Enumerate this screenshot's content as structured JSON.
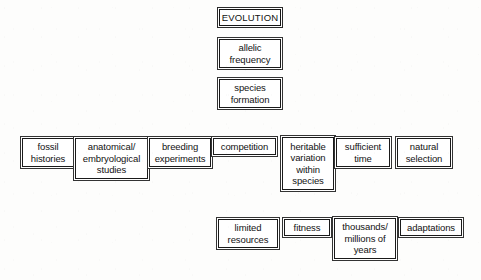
{
  "diagram": {
    "background_color": "#fdfdfc",
    "box_border_color": "#1a1a1a",
    "text_color": "#121212",
    "connectors": "none",
    "columns": {
      "top_stack": [
        {
          "id": "evolution",
          "label": "EVOLUTION",
          "x": 219,
          "y": 9,
          "w": 62,
          "h": 17,
          "style": "caps"
        },
        {
          "id": "allelic-frequency",
          "label": "allelic\nfrequency",
          "x": 219,
          "y": 39,
          "w": 62,
          "h": 29,
          "style": "thin"
        },
        {
          "id": "species-formation",
          "label": "species\nformation",
          "x": 219,
          "y": 79,
          "w": 62,
          "h": 29,
          "style": "thin"
        }
      ],
      "middle_row": [
        {
          "id": "fossil-histories",
          "label": "fossil\nhistories",
          "x": 22,
          "y": 138,
          "w": 52,
          "h": 29,
          "style": "thin"
        },
        {
          "id": "anatomical-embryological-studies",
          "label": "anatomical/\nembryological\nstudies",
          "x": 75,
          "y": 138,
          "w": 73,
          "h": 41,
          "style": "thin"
        },
        {
          "id": "breeding-experiments",
          "label": "breeding\nexperiments",
          "x": 149,
          "y": 138,
          "w": 62,
          "h": 29,
          "style": "thin"
        },
        {
          "id": "competition",
          "label": "competition",
          "x": 213,
          "y": 138,
          "w": 63,
          "h": 17,
          "style": "thin"
        },
        {
          "id": "heritable-variation-within-species",
          "label": "heritable\nvariation\nwithin\nspecies",
          "x": 282,
          "y": 137,
          "w": 52,
          "h": 53,
          "style": "thin"
        },
        {
          "id": "sufficient-time",
          "label": "sufficient\ntime",
          "x": 336,
          "y": 138,
          "w": 54,
          "h": 29,
          "style": "thin"
        },
        {
          "id": "natural-selection",
          "label": "natural\nselection",
          "x": 397,
          "y": 138,
          "w": 54,
          "h": 29,
          "style": "thin"
        }
      ],
      "bottom_row": [
        {
          "id": "limited-resources",
          "label": "limited\nresources",
          "x": 218,
          "y": 219,
          "w": 60,
          "h": 29,
          "style": "thin"
        },
        {
          "id": "fitness",
          "label": "fitness",
          "x": 284,
          "y": 219,
          "w": 46,
          "h": 17,
          "style": "thin"
        },
        {
          "id": "thousands-millions-of-years",
          "label": "thousands/\nmillions of\nyears",
          "x": 334,
          "y": 218,
          "w": 62,
          "h": 41,
          "style": "thin"
        },
        {
          "id": "adaptations",
          "label": "adaptations",
          "x": 400,
          "y": 219,
          "w": 62,
          "h": 17,
          "style": "thin"
        }
      ]
    }
  }
}
